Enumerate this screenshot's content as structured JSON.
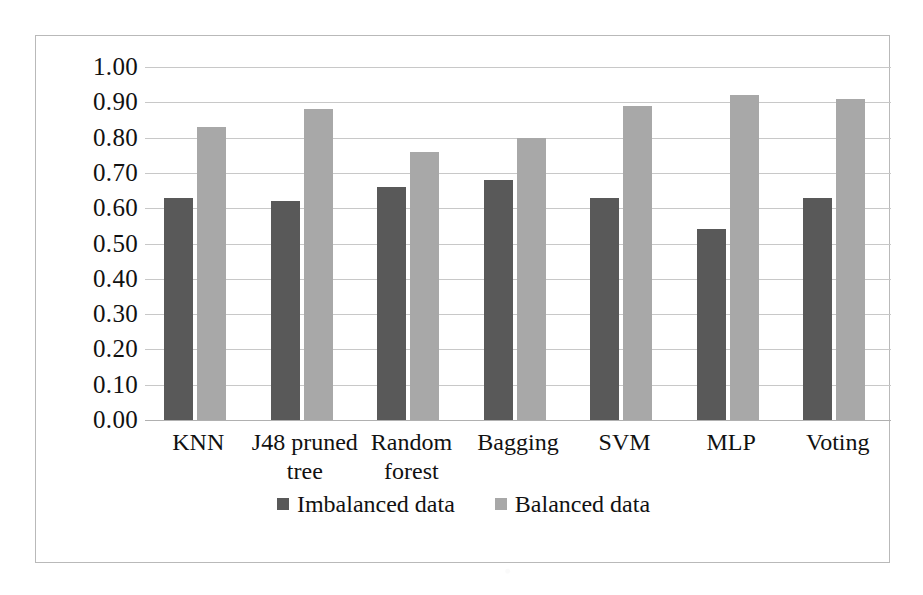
{
  "chart_data": {
    "type": "bar",
    "title": "",
    "subtitle": "",
    "xlabel": "",
    "ylabel": "",
    "ylim": [
      0.0,
      1.0
    ],
    "ytick_step": 0.1,
    "grid": true,
    "legend_position": "bottom-center",
    "orientation": "vertical-grouped",
    "categories": [
      "KNN",
      "J48 pruned tree",
      "Random forest",
      "Bagging",
      "SVM",
      "MLP",
      "Voting"
    ],
    "ytick_labels": [
      "1.00",
      "0.90",
      "0.80",
      "0.70",
      "0.60",
      "0.50",
      "0.40",
      "0.30",
      "0.20",
      "0.10",
      "0.00"
    ],
    "ytick_values": [
      1.0,
      0.9,
      0.8,
      0.7,
      0.6,
      0.5,
      0.4,
      0.3,
      0.2,
      0.1,
      0.0
    ],
    "series": [
      {
        "name": "Imbalanced data",
        "color": "#595959",
        "values": [
          0.63,
          0.62,
          0.66,
          0.68,
          0.63,
          0.54,
          0.63
        ]
      },
      {
        "name": "Balanced data",
        "color": "#a8a8a8",
        "values": [
          0.83,
          0.88,
          0.76,
          0.8,
          0.89,
          0.92,
          0.91
        ]
      }
    ]
  },
  "legend": {
    "items": [
      {
        "label": "Imbalanced data",
        "color": "#595959",
        "marker": "square-marker"
      },
      {
        "label": "Balanced data",
        "color": "#a8a8a8",
        "marker": "square-marker"
      }
    ]
  },
  "frame": {
    "border_color": "#b9b9b9",
    "background": "#ffffff",
    "gridline_color": "#c8c8c8"
  }
}
